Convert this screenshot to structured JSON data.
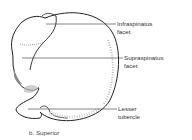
{
  "figure": {
    "caption": "b. Superior",
    "labels": [
      {
        "id": "infraspinatus",
        "line1": "Infraspinatus",
        "line2": "facet"
      },
      {
        "id": "supraspinatus",
        "line1": "Supraspinatus",
        "line2": "facet"
      },
      {
        "id": "lesser-tubercle",
        "line1": "Lesser",
        "line2": "tubercle"
      }
    ],
    "colors": {
      "stroke": "#222222",
      "shade": "#9a9a9a",
      "text": "#333333"
    }
  }
}
